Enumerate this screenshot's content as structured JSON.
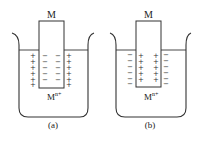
{
  "diagram": {
    "panels": [
      {
        "id": "a",
        "caption": "(a)",
        "electrode_label": "M",
        "ion_label": "M",
        "ion_superscript": "n+",
        "electrode_charge": "−",
        "solution_charge": "+"
      },
      {
        "id": "b",
        "caption": "(b)",
        "electrode_label": "M",
        "ion_label": "M",
        "ion_superscript": "n+",
        "electrode_charge": "+",
        "solution_charge": "−"
      }
    ],
    "colors": {
      "line": "#333333",
      "text": "#222222"
    }
  }
}
